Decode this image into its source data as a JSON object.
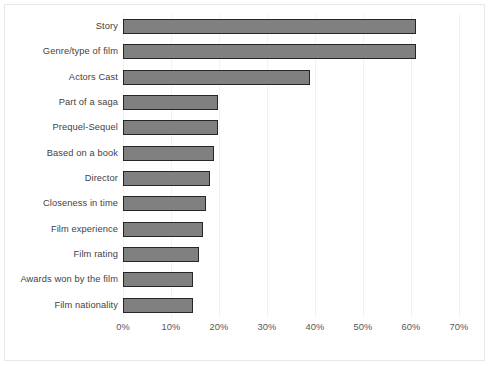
{
  "chart_data": {
    "type": "bar",
    "orientation": "horizontal",
    "title": "",
    "xlabel": "",
    "ylabel": "",
    "xlim": [
      0,
      70
    ],
    "xtick_labels": [
      "0%",
      "10%",
      "20%",
      "30%",
      "40%",
      "50%",
      "60%",
      "70%"
    ],
    "xtick_values": [
      0,
      10,
      20,
      30,
      40,
      50,
      60,
      70
    ],
    "grid": "vertical",
    "legend": "none",
    "bar_color": "#808080",
    "bar_edge_color": "#262626",
    "categories": [
      "Story",
      "Genre/type of film",
      "Actors Cast",
      "Part of a saga",
      "Prequel-Sequel",
      "Based on a book",
      "Director",
      "Closeness in time",
      "Film experience",
      "Film rating",
      "Awards won by the film",
      "Film nationality"
    ],
    "values": [
      61,
      61,
      39,
      19.8,
      19.8,
      19,
      18.2,
      17.3,
      16.7,
      15.8,
      14.6,
      14.6
    ]
  }
}
